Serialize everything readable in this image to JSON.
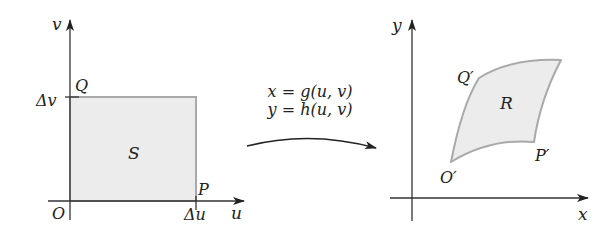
{
  "left_panel": {
    "axis_labels": {
      "horizontal": "u",
      "vertical": "v"
    },
    "region_label": "S",
    "points": {
      "origin": "O",
      "p": "P",
      "q": "Q"
    },
    "ticks": {
      "du": "Δu",
      "dv": "Δv"
    }
  },
  "transformation": {
    "eq1": "x = g(u, v)",
    "eq2": "y = h(u, v)"
  },
  "right_panel": {
    "axis_labels": {
      "horizontal": "x",
      "vertical": "y"
    },
    "region_label": "R",
    "points": {
      "origin": "O′",
      "p": "P′",
      "q": "Q′"
    }
  },
  "colors": {
    "region_fill": "#ececec",
    "region_stroke": "#a9a9a9",
    "axis": "#333333",
    "text": "#222222"
  }
}
